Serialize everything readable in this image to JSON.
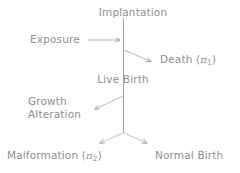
{
  "figure": {
    "type": "flow-diagram",
    "background_color": "#ffffff",
    "ink_color": "#8f8f8f",
    "nodes": {
      "implantation": "Implantation",
      "exposure": "Exposure",
      "death": "Death",
      "death_symbol": "π",
      "death_subscript": "1",
      "live_birth": "Live Birth",
      "growth_line1": "Growth",
      "growth_line2": "Alteration",
      "malformation": "Malformation",
      "malformation_symbol": "π",
      "malformation_subscript": "2",
      "normal_birth": "Normal Birth"
    },
    "paren_open": "(",
    "paren_close": ")",
    "edges": [
      {
        "name": "exposure-arrow",
        "from": "Exposure",
        "to": "timeline",
        "direction": "right"
      },
      {
        "name": "death-branch",
        "from": "timeline",
        "to": "Death",
        "direction": "down-right"
      },
      {
        "name": "growth-branch",
        "from": "timeline",
        "to": "Growth Alteration",
        "direction": "down-left"
      },
      {
        "name": "malformation-branch",
        "from": "fork",
        "to": "Malformation",
        "direction": "down-left"
      },
      {
        "name": "normal-birth-branch",
        "from": "fork",
        "to": "Normal Birth",
        "direction": "down-right"
      }
    ],
    "timeline": {
      "name": "gestation-timeline",
      "top": "Implantation",
      "bottom": "birth-fork"
    }
  }
}
